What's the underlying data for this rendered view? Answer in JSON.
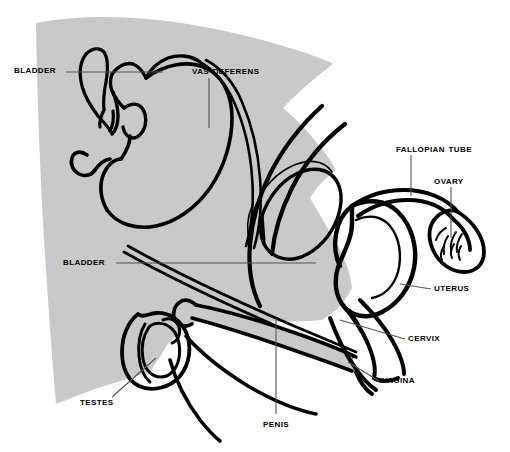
{
  "figure": {
    "background_color": "#ffffff",
    "shaded_region_color": "#c9c9c9",
    "outline_color": "#000000",
    "leader_line_color": "#555555"
  },
  "labels": [
    {
      "id": "bladder-male",
      "text": "Bladder",
      "name": "label-bladder-male"
    },
    {
      "id": "vas-deferens",
      "text": "Vas Deferens",
      "name": "label-vas-deferens"
    },
    {
      "id": "fallopian-tube",
      "text": "Fallopian Tube",
      "name": "label-fallopian-tube"
    },
    {
      "id": "ovary",
      "text": "Ovary",
      "name": "label-ovary"
    },
    {
      "id": "bladder-female",
      "text": "Bladder",
      "name": "label-bladder-female"
    },
    {
      "id": "uterus",
      "text": "Uterus",
      "name": "label-uterus"
    },
    {
      "id": "cervix",
      "text": "Cervix",
      "name": "label-cervix"
    },
    {
      "id": "vagina",
      "text": "Vagina",
      "name": "label-vagina"
    },
    {
      "id": "testes",
      "text": "Testes",
      "name": "label-testes"
    },
    {
      "id": "penis",
      "text": "Penis",
      "name": "label-penis"
    }
  ]
}
